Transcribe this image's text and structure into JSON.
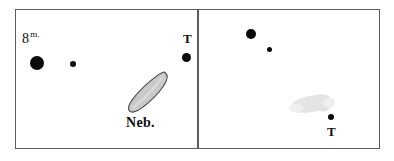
{
  "figure": {
    "background_color": "#ffffff",
    "frame_color": "#5d5d5d",
    "ink_color": "#0a0a0a"
  },
  "panels": [
    {
      "id": "left",
      "name": "left-chart-panel",
      "nebula": {
        "label": "Neb.",
        "fill_color": "#c9c9c9",
        "outline_color": "#4a4a4a",
        "visible_outline": true
      },
      "labels": {
        "magnitude_value": "8",
        "magnitude_superscript": "m.",
        "star_t": "T",
        "nebula": "Neb."
      },
      "stars": [
        {
          "name": "bright-star",
          "magnitude_label": "8",
          "radius_px": 7
        },
        {
          "name": "faint-star",
          "magnitude_label": "",
          "radius_px": 3
        },
        {
          "name": "star-t",
          "magnitude_label": "T",
          "radius_px": 4.5
        }
      ]
    },
    {
      "id": "right",
      "name": "right-chart-panel",
      "nebula": {
        "label": "",
        "fill_color": "#e2e2e2",
        "outline_color": "none",
        "visible_outline": false
      },
      "labels": {
        "star_t": "T"
      },
      "stars": [
        {
          "name": "bright-star",
          "magnitude_label": "",
          "radius_px": 5
        },
        {
          "name": "faint-star",
          "magnitude_label": "",
          "radius_px": 2.5
        },
        {
          "name": "star-t",
          "magnitude_label": "T",
          "radius_px": 3
        }
      ]
    }
  ]
}
